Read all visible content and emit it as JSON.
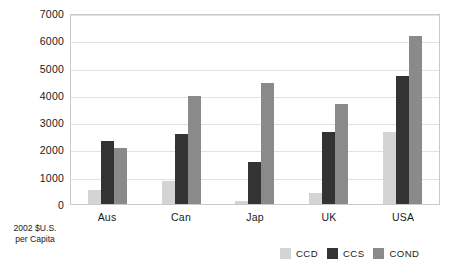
{
  "chart_data": {
    "type": "bar",
    "title": "",
    "subtitle": "",
    "xlabel": "",
    "ylabel": "2002 $U.S. per Capita",
    "ylabel_lines": [
      "2002 $U.S.",
      "per Capita"
    ],
    "categories": [
      "Aus",
      "Can",
      "Jap",
      "UK",
      "USA"
    ],
    "series": [
      {
        "name": "CCD",
        "color": "#d4d4d4",
        "values": [
          500,
          850,
          100,
          400,
          2650
        ]
      },
      {
        "name": "CCS",
        "color": "#333333",
        "values": [
          2300,
          2550,
          1550,
          2650,
          4700
        ]
      },
      {
        "name": "COND",
        "color": "#8a8a8a",
        "values": [
          2050,
          3950,
          4450,
          3650,
          6150
        ]
      }
    ],
    "ylim": [
      0,
      7000
    ],
    "yticks": [
      0,
      1000,
      2000,
      3000,
      4000,
      5000,
      6000,
      7000
    ],
    "ytick_labels": [
      "0",
      "1000",
      "2000",
      "3000",
      "4000",
      "5000",
      "6000",
      "7000"
    ],
    "grid": true,
    "grid_axis": "y",
    "legend_position": "bottom-right",
    "legend": [
      "CCD",
      "CCS",
      "COND"
    ],
    "background_color": "#ffffff",
    "frame_color": "#c9c9c9",
    "gridline_color": "#e2e2e2"
  }
}
